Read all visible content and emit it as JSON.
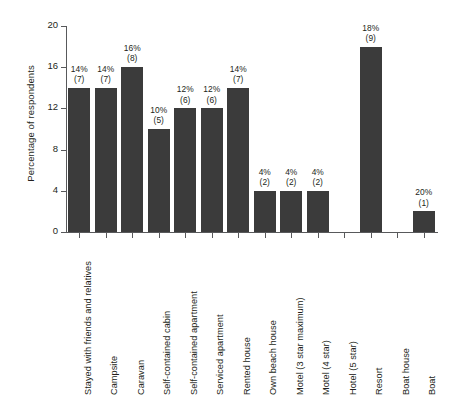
{
  "chart_data": {
    "type": "bar",
    "title": "",
    "xlabel": "",
    "ylabel": "Percentage of respondents",
    "ylim": [
      0,
      20
    ],
    "yticks": [
      0,
      4,
      8,
      12,
      16,
      20
    ],
    "grid": false,
    "legend": "none",
    "bar_color": "#3b3b3b",
    "axis_color": "#58595b",
    "background": "#ffffff",
    "categories": [
      "Stayed with friends and relatives",
      "Campsite",
      "Caravan",
      "Self-contained cabin",
      "Self-contained apartment",
      "Serviced apartment",
      "Rented house",
      "Own beach house",
      "Motel (3 star maximum)",
      "Motel (4 star)",
      "Hotel (5 star)",
      "Resort",
      "Boat house",
      "Boat"
    ],
    "values": [
      14,
      14,
      16,
      10,
      12,
      12,
      14,
      4,
      4,
      4,
      0,
      18,
      0,
      2
    ],
    "counts": [
      7,
      7,
      8,
      5,
      6,
      6,
      7,
      2,
      2,
      2,
      0,
      9,
      0,
      1
    ],
    "point_labels": [
      "14%\n(7)",
      "14%\n(7)",
      "16%\n(8)",
      "10%\n(5)",
      "12%\n(6)",
      "12%\n(6)",
      "14%\n(7)",
      "4%\n(2)",
      "4%\n(2)",
      "4%\n(2)",
      "",
      "18%\n(9)",
      "",
      "20%\n(1)"
    ],
    "point_labels_pct": [
      "14%",
      "14%",
      "16%",
      "10%",
      "12%",
      "12%",
      "14%",
      "4%",
      "4%",
      "4%",
      "",
      "18%",
      "",
      "20%"
    ],
    "point_labels_count": [
      "(7)",
      "(7)",
      "(8)",
      "(5)",
      "(6)",
      "(6)",
      "(7)",
      "(2)",
      "(2)",
      "(2)",
      "",
      "(9)",
      "",
      "(1)"
    ]
  }
}
